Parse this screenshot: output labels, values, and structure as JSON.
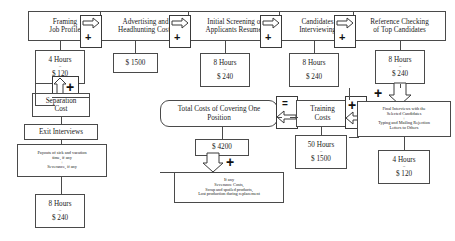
{
  "diagram": {
    "title": "Total Costs of Covering One Position",
    "process_row": [
      {
        "label": "Framing\nJob Profile"
      },
      {
        "label": "Advertising and\nHeadhunting Costs"
      },
      {
        "label": "Initial Screening of\nApplicants Resumes"
      },
      {
        "label": "Candidates\nInterviewing"
      },
      {
        "label": "Reference Checking\nof Top Candidates"
      }
    ],
    "cost_row": [
      {
        "hours": "4 Hours",
        "eq": "=",
        "amount": "$ 120"
      },
      {
        "hours": "",
        "eq": "",
        "amount": "$ 1500"
      },
      {
        "hours": "8 Hours",
        "eq": "=",
        "amount": "$ 240"
      },
      {
        "hours": "8 Hours",
        "eq": "=",
        "amount": "$ 240"
      },
      {
        "hours": "8 Hours",
        "eq": "=",
        "amount": "$ 240"
      }
    ],
    "separation": {
      "cost_label": "Separation\nCost",
      "exit_interviews": "Exit Interviews",
      "payouts": "Payouts of sick and vacation\ntime, if any\n+\nSeverance, if any",
      "hours": "8 Hours",
      "eq": "=",
      "amount": "$ 240"
    },
    "total": {
      "label": "Total Costs of Covering One\nPosition",
      "amount": "$ 4200",
      "notes": "If any\nSeverance Costs,\nScrap and spoiled products,\nLost production during replacement"
    },
    "training": {
      "label": "Training\nCosts",
      "hours": "50 Hours",
      "eq": "=",
      "amount": "$ 1500"
    },
    "final": {
      "label": "Final Interviews with the\nSelected Candidates\n+\nTyping and Mailing Rejection\nLetters to Others",
      "hours": "4 Hours",
      "eq": "=",
      "amount": "$ 120"
    },
    "operators": {
      "plus": "+",
      "equals": "="
    }
  }
}
